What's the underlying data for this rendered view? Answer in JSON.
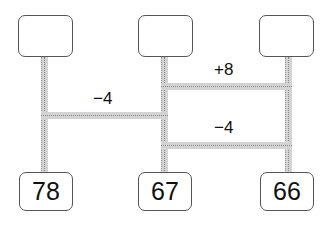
{
  "diagram": {
    "top_boxes": [
      "",
      "",
      ""
    ],
    "bottom_boxes": [
      "78",
      "67",
      "66"
    ],
    "operations": [
      {
        "label": "−4",
        "from": "left",
        "to": "middle"
      },
      {
        "label": "+8",
        "from": "middle",
        "to": "right"
      },
      {
        "label": "−4",
        "from": "middle",
        "to": "right"
      }
    ]
  }
}
